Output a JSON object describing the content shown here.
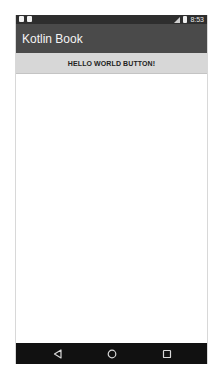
{
  "status_bar": {
    "time": "8:53",
    "left_icons": [
      "notification-icon",
      "notification-icon"
    ],
    "right_icons": [
      "signal-icon",
      "battery-icon"
    ]
  },
  "toolbar": {
    "title": "Kotlin Book",
    "background": "#4a4a4a"
  },
  "main": {
    "hello_button_label": "HELLO WORLD BUTTON!"
  },
  "nav_bar": {
    "buttons": [
      "back-icon",
      "home-icon",
      "recents-icon"
    ]
  }
}
